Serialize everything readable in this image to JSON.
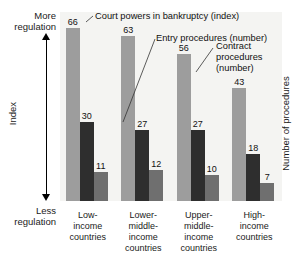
{
  "chart_data": {
    "type": "bar",
    "title": "",
    "categories": [
      "Low-income countries",
      "Lower-middle-income countries",
      "Upper-middle-income countries",
      "High-income countries"
    ],
    "series": [
      {
        "name": "Court powers in bankruptcy (index)",
        "values": [
          66,
          63,
          56,
          43
        ],
        "color": "#9d9d9d"
      },
      {
        "name": "Entry procedures (number)",
        "values": [
          30,
          27,
          27,
          18
        ],
        "color": "#2e2e2e"
      },
      {
        "name": "Contract procedures (number)",
        "values": [
          11,
          12,
          10,
          7
        ],
        "color": "#6f6f6f"
      }
    ],
    "ylabel_left": "Index",
    "ylabel_right": "Number of procedures",
    "axis_top_label": "More regulation",
    "axis_bottom_label": "Less regulation",
    "ylim": [
      0,
      72
    ],
    "grid": false,
    "legend": "callouts-with-leader-lines"
  },
  "axis": {
    "more_regulation_line1": "More",
    "more_regulation_line2": "regulation",
    "less_regulation_line1": "Less",
    "less_regulation_line2": "regulation",
    "index_label": "Index",
    "right_label": "Number of procedures"
  },
  "callouts": {
    "court_powers": "Court powers in bankruptcy (index)",
    "entry_procedures": "Entry procedures (number)",
    "contract_line1": "Contract",
    "contract_line2": "procedures",
    "contract_line3": "(number)"
  },
  "categories": [
    {
      "line1": "Low-",
      "line2": "income",
      "line3": "countries",
      "line4": ""
    },
    {
      "line1": "Lower-",
      "line2": "middle-",
      "line3": "income",
      "line4": "countries"
    },
    {
      "line1": "Upper-",
      "line2": "middle-",
      "line3": "income",
      "line4": "countries"
    },
    {
      "line1": "High-",
      "line2": "income",
      "line3": "countries",
      "line4": ""
    }
  ],
  "values": {
    "g0": {
      "s0": "66",
      "s1": "30",
      "s2": "11"
    },
    "g1": {
      "s0": "63",
      "s1": "27",
      "s2": "12"
    },
    "g2": {
      "s0": "56",
      "s1": "27",
      "s2": "10"
    },
    "g3": {
      "s0": "43",
      "s1": "18",
      "s2": "7"
    }
  }
}
